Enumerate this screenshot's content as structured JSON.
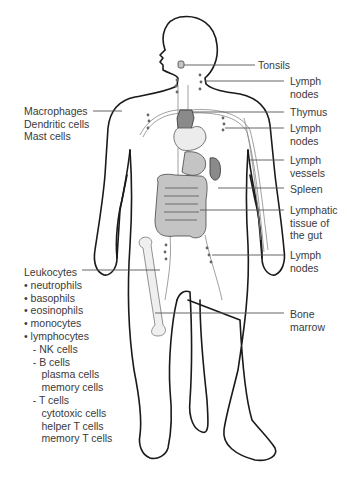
{
  "figure": {
    "labels_right": [
      {
        "id": "tonsils",
        "text": "Tonsils"
      },
      {
        "id": "lymph-nodes-neck",
        "text": "Lymph\nnodes"
      },
      {
        "id": "thymus",
        "text": "Thymus"
      },
      {
        "id": "lymph-nodes-axilla",
        "text": "Lymph\nnodes"
      },
      {
        "id": "lymph-vessels",
        "text": "Lymph\nvessels"
      },
      {
        "id": "spleen",
        "text": "Spleen"
      },
      {
        "id": "gut-lymphatic-tissue",
        "text": "Lymphatic\ntissue of\nthe gut"
      },
      {
        "id": "lymph-nodes-groin",
        "text": "Lymph\nnodes"
      },
      {
        "id": "bone-marrow",
        "text": "Bone\nmarrow"
      }
    ],
    "labels_left": {
      "tissue_cells": "Macrophages\nDendritic cells\nMast cells",
      "leukocytes": {
        "title": "Leukocytes",
        "items": [
          "• neutrophils",
          "• basophils",
          "• eosinophils",
          "• monocytes",
          "• lymphocytes",
          "   - NK cells",
          "   - B cells",
          "      plasma cells",
          "      memory cells",
          "   - T cells",
          "      cytotoxic cells",
          "      helper T cells",
          "      memory T cells"
        ]
      }
    },
    "colors": {
      "outline": "#1a1a1a",
      "organ_dark": "#8a8a8a",
      "organ_mid": "#c4c4c4",
      "text": "#3a3a3a"
    }
  }
}
